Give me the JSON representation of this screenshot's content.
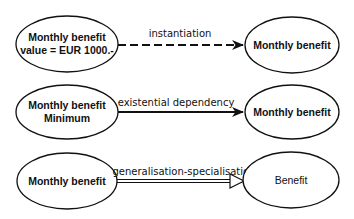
{
  "diagram": {
    "type": "relationship-notation",
    "colors": {
      "stroke": "#111111",
      "background": "#ffffff"
    },
    "rows": [
      {
        "source": {
          "lines": [
            "Monthly benefit",
            "value = EUR 1000.-"
          ]
        },
        "relation": {
          "label": "instantiation",
          "line_style": "dashed",
          "arrow": "filled"
        },
        "target": {
          "lines": [
            "Monthly benefit"
          ]
        }
      },
      {
        "source": {
          "lines": [
            "Monthly benefit",
            "Minimum"
          ]
        },
        "relation": {
          "label": "existential dependency",
          "line_style": "solid",
          "arrow": "filled"
        },
        "target": {
          "lines": [
            "Monthly benefit"
          ]
        }
      },
      {
        "source": {
          "lines": [
            "Monthly benefit"
          ]
        },
        "relation": {
          "label": "generalisation-specialisation",
          "line_style": "double",
          "arrow": "hollow-triangle"
        },
        "target": {
          "lines": [
            "Benefit"
          ]
        }
      }
    ]
  }
}
